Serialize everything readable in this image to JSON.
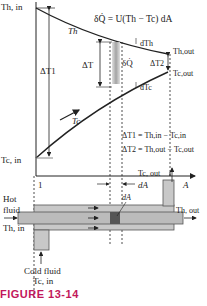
{
  "figure": {
    "caption": "FIGURE 13-14",
    "caption_color": "#c2185b"
  },
  "graph": {
    "equation": "δQ̇ = U(Th − Tc) dA",
    "labels": {
      "th_in": "Th, in",
      "tc_in": "Tc, in",
      "th": "Th",
      "tc": "Tc",
      "th_out": "Th,out",
      "tc_out": "Tc,out",
      "dth": "dTh",
      "dtc": "dTc",
      "dt": "ΔT",
      "dq": "δQ̇",
      "dt1": "ΔT1",
      "dt2": "ΔT2",
      "def1": "ΔT1 = Th,in − Tc,in",
      "def2": "ΔT2 = Th,out − Tc,out",
      "x1": "1",
      "x2": "2",
      "xaxis": "A",
      "da": "dA"
    }
  },
  "exchanger": {
    "hot_fluid": "Hot",
    "hot_fluid2": "fluid",
    "th_in": "Th, in",
    "th_out": "Th, out",
    "tc_out": "Tc, out",
    "cold_fluid": "Cold fluid",
    "tc_in": "Tc, in",
    "da": "dA"
  }
}
